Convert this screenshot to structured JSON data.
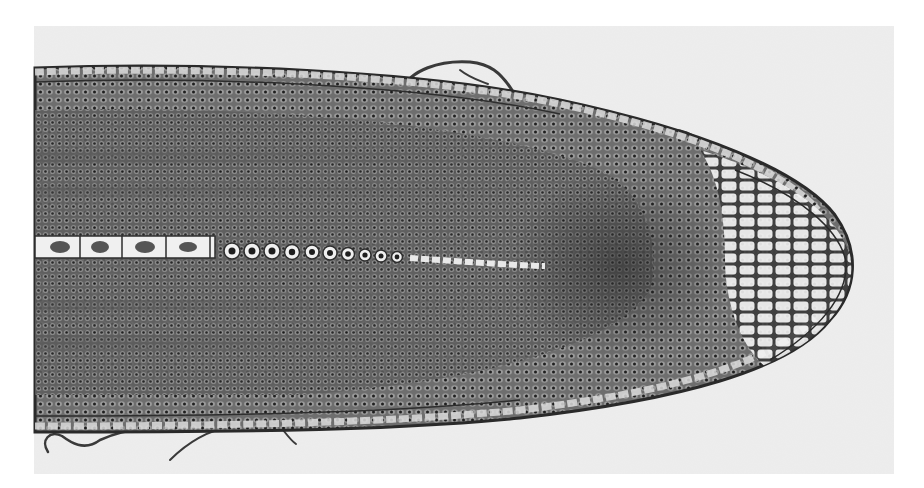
{
  "image": {
    "subject": "longitudinal section of a plant root tip (micrograph)",
    "mode": "grayscale",
    "colors": {
      "margin": "#ffffff",
      "background": "#ececec",
      "tissue_dark": "#4a4a4a",
      "tissue_mid": "#7a7a7a",
      "cell_wall": "#2e2e2e",
      "cap_cell_fill": "#f4f4f4",
      "nucleus": "#1e1e1e"
    },
    "regions": [
      {
        "name": "root-body",
        "bounds": [
          35,
          65,
          850,
          430
        ]
      },
      {
        "name": "root-cap",
        "center": [
          790,
          260
        ]
      },
      {
        "name": "central-cell-file",
        "y": 250,
        "x_range": [
          35,
          540
        ]
      }
    ],
    "text": []
  }
}
